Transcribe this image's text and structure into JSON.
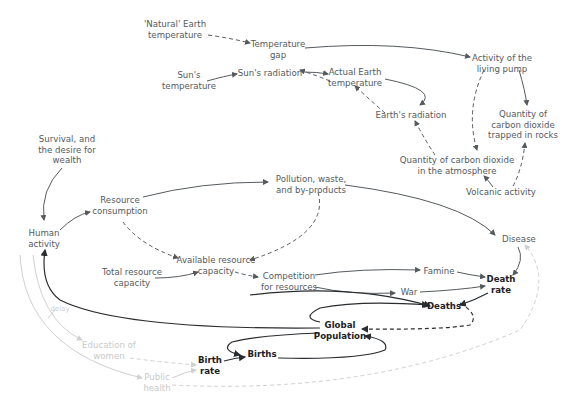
{
  "diagram": {
    "colors": {
      "text": "#555a5e",
      "text_dark": "#1e2124",
      "text_faint": "#c8c9ca",
      "edge": "#555a5e",
      "edge_dark": "#2a2d30",
      "edge_faint": "#cfd0d1"
    },
    "nodes": {
      "natural_earth_temp": "'Natural' Earth\ntemperature",
      "temperature_gap": "Temperature\ngap",
      "suns_temperature": "Sun's\ntemperature",
      "suns_radiation": "Sun's radiation",
      "actual_earth_temp": "Actual Earth\ntemperature",
      "earths_radiation": "Earth's radiation",
      "activity_living_pump": "Activity of the\nliving pump",
      "co2_rocks": "Quantity of\ncarbon dioxide\ntrapped in rocks",
      "co2_atmosphere": "Quantity of carbon dioxide\nin the atmosphere",
      "volcanic_activity": "Volcanic activity",
      "survival_desire": "Survival, and\nthe desire for\nwealth",
      "human_activity": "Human\nactivity",
      "resource_consumption": "Resource\nconsumption",
      "pollution": "Pollution, waste,\nand by-products",
      "available_resource": "Available resource\ncapacity",
      "total_resource": "Total resource\ncapacity",
      "competition": "Competition\nfor resources",
      "famine": "Famine",
      "war": "War",
      "disease": "Disease",
      "death_rate": "Death\nrate",
      "deaths": "Deaths",
      "global_population": "Global\nPopulation",
      "births": "Births",
      "birth_rate": "Birth\nrate",
      "education_women": "Education of\nwomen",
      "public_health": "Public\nhealth",
      "delay": "delay"
    }
  }
}
